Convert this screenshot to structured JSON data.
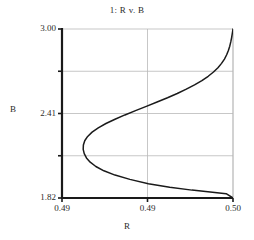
{
  "chart_data": {
    "type": "line",
    "title": "1: R v. B",
    "xlabel": "R",
    "ylabel": "B",
    "xlim": [
      0.49,
      0.5
    ],
    "ylim": [
      1.82,
      3.0
    ],
    "grid": true,
    "legend": false,
    "xticks": [
      0.49,
      0.495,
      0.5
    ],
    "xtick_labels": [
      "0.49",
      "0.49",
      "0.50"
    ],
    "yticks": [
      1.82,
      2.115,
      2.41,
      2.705,
      3.0
    ],
    "ytick_labels": [
      "1.82",
      "",
      "2.41",
      "",
      "3.00"
    ],
    "series": [
      {
        "name": "R v. B",
        "color": "#1a1a1a",
        "x": [
          0.5,
          0.49996,
          0.49992,
          0.49987,
          0.49981,
          0.49973,
          0.49963,
          0.4995,
          0.49933,
          0.49912,
          0.49886,
          0.49855,
          0.49818,
          0.49775,
          0.49727,
          0.49674,
          0.49617,
          0.49556,
          0.49493,
          0.4943,
          0.49368,
          0.4931,
          0.49257,
          0.49212,
          0.49176,
          0.4915,
          0.49133,
          0.49125,
          0.49124,
          0.4913,
          0.49143,
          0.49165,
          0.49198,
          0.49245,
          0.4931,
          0.49397,
          0.49505,
          0.4963,
          0.4976,
          0.4988,
          0.4996,
          1.0
        ],
        "y": [
          3.0,
          2.97,
          2.94,
          2.91,
          2.88,
          2.85,
          2.82,
          2.79,
          2.76,
          2.73,
          2.7,
          2.67,
          2.64,
          2.61,
          2.58,
          2.55,
          2.52,
          2.49,
          2.46,
          2.43,
          2.4,
          2.37,
          2.34,
          2.31,
          2.28,
          2.25,
          2.22,
          2.19,
          2.16,
          2.13,
          2.1,
          2.07,
          2.04,
          2.01,
          1.98,
          1.95,
          1.92,
          1.895,
          1.875,
          1.86,
          1.85,
          1.82
        ]
      }
    ],
    "annotations": [],
    "nose_point": {
      "x": 0.49124,
      "y": 2.16
    },
    "styles": {
      "grid_color": "#b9b9b9",
      "spine_color": "#1a1a1a",
      "curve_color": "#1a1a1a",
      "background": "#ffffff"
    }
  },
  "plot_geometry": {
    "left": 62,
    "right": 233,
    "top": 29,
    "bottom": 198
  }
}
